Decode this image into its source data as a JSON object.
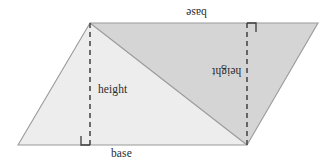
{
  "figure": {
    "kind": "parallelogram-area-diagram",
    "background_color": "#ffffff",
    "outline_color": "#9a9a9a",
    "fill_light": "#ededed",
    "fill_dark": "#d5d5d5",
    "dash_color": "#4a4a4a",
    "marker_color": "#3c3c3c",
    "text_color": "#2b2b2b",
    "vertices": {
      "bottom_left": [
        18,
        145
      ],
      "top_left": [
        90,
        23
      ],
      "top_right": [
        318,
        23
      ],
      "bottom_right": [
        247,
        145
      ]
    },
    "height_segments": [
      {
        "name": "left-height",
        "x": 90,
        "y_top": 23,
        "y_bottom": 145
      },
      {
        "name": "right-height",
        "x": 247,
        "y_top": 23,
        "y_bottom": 145
      }
    ],
    "diagonal": {
      "from": [
        90,
        23
      ],
      "to": [
        247,
        145
      ]
    },
    "right_angle_markers": [
      {
        "name": "left-right-angle",
        "x": 90,
        "y": 145,
        "size": 9,
        "orientation": "up-left"
      },
      {
        "name": "right-right-angle",
        "x": 247,
        "y": 23,
        "size": 9,
        "orientation": "down-right"
      }
    ]
  },
  "labels": {
    "base_bottom": "base",
    "base_top": "base",
    "height_left": "height",
    "height_right": "height"
  }
}
